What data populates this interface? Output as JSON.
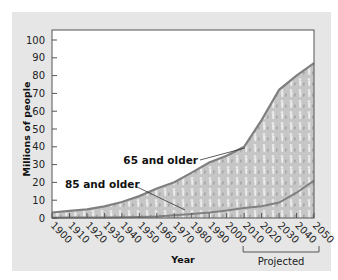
{
  "chart_data": {
    "type": "area",
    "title": "",
    "xlabel": "Year",
    "ylabel": "Millions of people",
    "ylim": [
      0,
      100
    ],
    "xlim": [
      1900,
      2050
    ],
    "grid": false,
    "x": [
      1900,
      1910,
      1920,
      1930,
      1940,
      1950,
      1960,
      1970,
      1980,
      1990,
      2000,
      2010,
      2020,
      2030,
      2040,
      2050
    ],
    "x_tick_labels": [
      "1900",
      "1910",
      "1920",
      "1930",
      "1940",
      "1950",
      "1960",
      "1970",
      "1980",
      "1990",
      "2000",
      "2010",
      "2020",
      "2030",
      "2040",
      "2050"
    ],
    "y_ticks": [
      0,
      10,
      20,
      30,
      40,
      50,
      60,
      70,
      80,
      90,
      100
    ],
    "y_tick_labels": [
      "0",
      "10",
      "20",
      "30",
      "40",
      "50",
      "60",
      "70",
      "80",
      "90",
      "100"
    ],
    "series": [
      {
        "name": "65 and older",
        "values": [
          3.1,
          4.0,
          4.9,
          6.6,
          9.0,
          12.3,
          16.6,
          20.1,
          25.5,
          31.2,
          35.0,
          40.0,
          55.0,
          72.0,
          80.0,
          87.0
        ]
      },
      {
        "name": "85 and older",
        "values": [
          0.1,
          0.2,
          0.2,
          0.3,
          0.4,
          0.6,
          0.9,
          1.5,
          2.2,
          3.1,
          4.2,
          5.7,
          6.6,
          8.7,
          14.2,
          21.0
        ]
      }
    ],
    "annotations": [
      {
        "text": "65 and older",
        "points_to": "65 and older curve near 2010"
      },
      {
        "text": "85 and older",
        "points_to": "85 and older curve near 1975"
      },
      {
        "text": "Projected",
        "range": [
          2010,
          2050
        ]
      }
    ]
  },
  "labels": {
    "ylabel": "Millions of people",
    "xlabel": "Year",
    "annot_65": "65 and older",
    "annot_85": "85 and older",
    "projected": "Projected"
  },
  "colors": {
    "panel": "#e6e6e6",
    "plot_bg": "#ffffff",
    "area_fill": "#c9c9c9",
    "area_line": "#808080",
    "axis": "#555555"
  }
}
